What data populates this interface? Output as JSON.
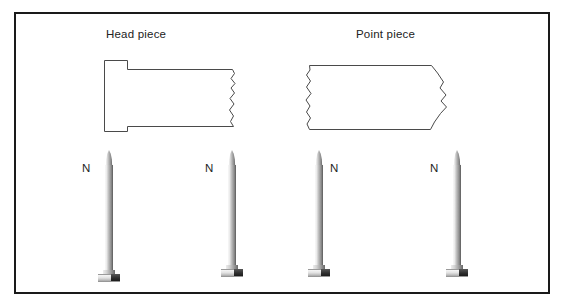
{
  "figure": {
    "title_head": "Head piece",
    "title_point": "Point piece",
    "border_color": "#1a1a1a",
    "background_color": "#ffffff",
    "outline_color": "#4a4a4a"
  },
  "labels": [
    {
      "text": "Head piece",
      "name": "head-piece-label"
    },
    {
      "text": "Point piece",
      "name": "point-piece-label"
    }
  ],
  "pieces": [
    {
      "name": "head-piece-outline",
      "description": "nail head segment with flat head at left and jagged break line at right",
      "break_side": "right"
    },
    {
      "name": "point-piece-outline",
      "description": "nail point segment with jagged break line at left and tapered point at right",
      "break_side": "left"
    }
  ],
  "nails": [
    {
      "label": "N",
      "label_side": "left"
    },
    {
      "label": "N",
      "label_side": "left"
    },
    {
      "label": "N",
      "label_side": "right"
    },
    {
      "label": "N",
      "label_side": "left"
    }
  ]
}
